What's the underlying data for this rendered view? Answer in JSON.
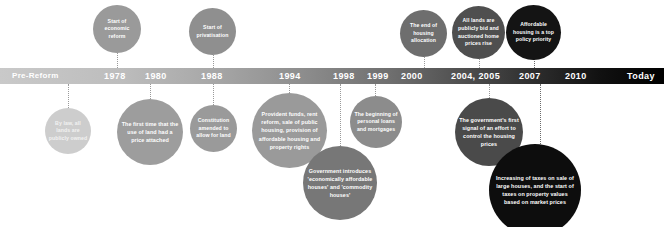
{
  "timeline": {
    "start_label": "Pre-Reform",
    "end_label": "Today",
    "ticks": [
      {
        "year": "1978"
      },
      {
        "year": "1980"
      },
      {
        "year": "1988"
      },
      {
        "year": "1994"
      },
      {
        "year": "1998"
      },
      {
        "year": "1999"
      },
      {
        "year": "2000"
      },
      {
        "year": "2004, 2005"
      },
      {
        "year": "2007"
      },
      {
        "year": "2010"
      }
    ],
    "colors": {
      "bar_start": "#c9c9c9",
      "bar_end": "#000000",
      "bubble_lightest": "#cfcfcf",
      "bubble_light": "#b3b3b3",
      "bubble_mid": "#8c8c8c",
      "bubble_dark": "#4a4a4a",
      "bubble_darkest": "#111111",
      "text": "#ffffff"
    }
  },
  "events_above": [
    {
      "id": "1978",
      "text": "Start of economic reform"
    },
    {
      "id": "1988",
      "text": "Start of privatisation"
    },
    {
      "id": "2000",
      "text": "The end of housing allocation"
    },
    {
      "id": "2004-2005",
      "text": "All lands are publicly bid and auctioned home prices rise"
    },
    {
      "id": "2007",
      "text": "Affordable housing is a top policy priority"
    }
  ],
  "events_below": [
    {
      "id": "pre-reform",
      "text": "By law, all lands are publicly owned"
    },
    {
      "id": "1980",
      "text": "The first time that the use of land had a price attached"
    },
    {
      "id": "1988",
      "text": "Constitution amended to allow for land"
    },
    {
      "id": "1994",
      "text": "Provident funds, rent reform, sale of public housing, provision of affordable housing and property rights"
    },
    {
      "id": "1998",
      "text": "Government introduces 'economically affordable houses' and 'commodity houses'"
    },
    {
      "id": "1999",
      "text": "The beginning of personal loans and mortgages"
    },
    {
      "id": "2004-2005",
      "text": "The government's first signal of an effort to control the housing prices"
    },
    {
      "id": "2010",
      "text": "Increasing of taxes on sale of large houses, and the start of taxes on property values based on market prices"
    }
  ]
}
